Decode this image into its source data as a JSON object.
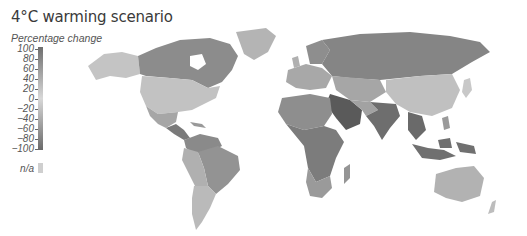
{
  "title": "4°C warming scenario",
  "legend": {
    "title": "Percentage change",
    "ticks": [
      "100",
      "80",
      "60",
      "40",
      "20",
      "0",
      "−20",
      "−40",
      "−60",
      "−80",
      "−100"
    ],
    "na_label": "n/a",
    "gradient": {
      "top_color": "#6e6e6e",
      "mid_color": "#d8d8d8",
      "bottom_color": "#6a6a6a",
      "na_color": "#cfcfcf"
    }
  },
  "map": {
    "projection": "world, Robinson-like",
    "regions": [
      {
        "name": "Alaska",
        "shade": "#c4c4c4"
      },
      {
        "name": "Canada",
        "shade": "#8c8c8c"
      },
      {
        "name": "Greenland",
        "shade": "#b4b4b4"
      },
      {
        "name": "United States",
        "shade": "#c2c2c2"
      },
      {
        "name": "Mexico",
        "shade": "#a6a6a6"
      },
      {
        "name": "Central America",
        "shade": "#7a7a7a"
      },
      {
        "name": "Northern South America",
        "shade": "#8a8a8a"
      },
      {
        "name": "Brazil",
        "shade": "#939393"
      },
      {
        "name": "Peru/Bolivia",
        "shade": "#b0b0b0"
      },
      {
        "name": "Argentina/Chile",
        "shade": "#bababa"
      },
      {
        "name": "Europe",
        "shade": "#a8a8a8"
      },
      {
        "name": "Scandinavia",
        "shade": "#8e8e8e"
      },
      {
        "name": "Russia",
        "shade": "#858585"
      },
      {
        "name": "Central Asia",
        "shade": "#a6a6a6"
      },
      {
        "name": "China",
        "shade": "#c0c0c0"
      },
      {
        "name": "Middle East",
        "shade": "#5a5a5a"
      },
      {
        "name": "India",
        "shade": "#6e6e6e"
      },
      {
        "name": "Southeast Asia",
        "shade": "#6a6a6a"
      },
      {
        "name": "Indonesia",
        "shade": "#707070"
      },
      {
        "name": "North Africa",
        "shade": "#8e8e8e"
      },
      {
        "name": "Central Africa",
        "shade": "#7c7c7c"
      },
      {
        "name": "Southern Africa",
        "shade": "#9a9a9a"
      },
      {
        "name": "Madagascar",
        "shade": "#959595"
      },
      {
        "name": "Australia",
        "shade": "#b2b2b2"
      },
      {
        "name": "Japan",
        "shade": "#c8c8c8"
      }
    ]
  }
}
